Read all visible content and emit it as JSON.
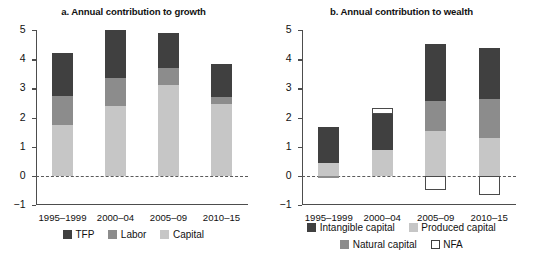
{
  "chart_data": [
    {
      "type": "bar",
      "panel": "a",
      "title": "a. Annual contribution to growth",
      "categories": [
        "1995–1999",
        "2000–04",
        "2005–09",
        "2010–15"
      ],
      "stacked": true,
      "series": [
        {
          "name": "Capital",
          "color": "#c6c6c6",
          "values": [
            1.75,
            2.4,
            3.1,
            2.45
          ]
        },
        {
          "name": "Labor",
          "color": "#8c8c8c",
          "values": [
            1.0,
            0.95,
            0.6,
            0.25
          ]
        },
        {
          "name": "TFP",
          "color": "#404040",
          "values": [
            1.45,
            1.65,
            1.2,
            1.15
          ]
        }
      ],
      "totals": [
        4.2,
        5.0,
        4.9,
        3.85
      ],
      "legend": [
        {
          "label": "TFP",
          "color": "#404040"
        },
        {
          "label": "Labor",
          "color": "#8c8c8c"
        },
        {
          "label": "Capital",
          "color": "#c6c6c6"
        }
      ],
      "xlabel": "",
      "ylabel": "",
      "ylim": [
        -1,
        5
      ],
      "yticks": [
        "5",
        "4",
        "3",
        "2",
        "1",
        "0",
        "−1"
      ],
      "grid": false,
      "legend_position": "bottom"
    },
    {
      "type": "bar",
      "panel": "b",
      "title": "b. Annual contribution to wealth",
      "categories": [
        "1995–1999",
        "2000–04",
        "2005–09",
        "2010–15"
      ],
      "stacked": true,
      "series": [
        {
          "name": "Natural capital",
          "color": "#8c8c8c",
          "values": [
            -0.07,
            0.0,
            0.0,
            0.0
          ]
        },
        {
          "name": "Produced capital",
          "color": "#c6c6c6",
          "values": [
            0.45,
            0.9,
            1.55,
            1.3
          ]
        },
        {
          "name": "Natural capital (upper)",
          "color": "#8c8c8c",
          "values": [
            0.0,
            0.0,
            1.0,
            1.35
          ]
        },
        {
          "name": "Intangible capital",
          "color": "#404040",
          "values": [
            1.22,
            1.23,
            1.97,
            1.75
          ]
        },
        {
          "name": "NFA",
          "color": "#ffffff",
          "values": [
            0.0,
            0.2,
            -0.5,
            -0.65
          ]
        }
      ],
      "totals": [
        1.6,
        2.33,
        4.52,
        4.4
      ],
      "legend": [
        {
          "label": "Intangible capital",
          "color": "#404040"
        },
        {
          "label": "Produced capital",
          "color": "#c6c6c6"
        },
        {
          "label": "Natural capital",
          "color": "#8c8c8c"
        },
        {
          "label": "NFA",
          "color": "#ffffff"
        }
      ],
      "xlabel": "",
      "ylabel": "",
      "ylim": [
        -1,
        5
      ],
      "yticks": [
        "5",
        "4",
        "3",
        "2",
        "1",
        "0",
        "−1"
      ],
      "grid": false,
      "legend_position": "bottom"
    }
  ]
}
